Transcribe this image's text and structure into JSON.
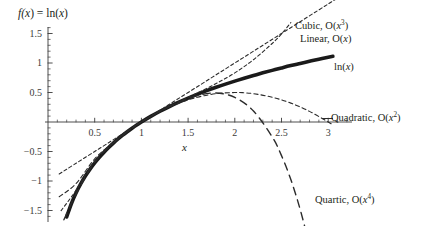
{
  "chart_data": {
    "type": "line",
    "title": "f(x) = ln(x)",
    "subtitle": "",
    "xlabel": "x",
    "ylabel": "",
    "xlim": [
      0.05,
      3.35
    ],
    "ylim": [
      -1.75,
      1.75
    ],
    "grid": false,
    "legend_position": "inline-annotations",
    "xticks": [
      0.5,
      1,
      1.5,
      2,
      2.5,
      3
    ],
    "xtick_labels": [
      "0.5",
      "1",
      "1.5",
      "2",
      "2.5",
      "3"
    ],
    "yticks": [
      -1.5,
      -1,
      -0.5,
      0.5,
      1,
      1.5
    ],
    "ytick_labels": [
      "-1.5",
      "-1",
      "-0.5",
      "0.5",
      "1",
      "1.5"
    ],
    "xminor_step": 0.1,
    "yminor_step": 0.1,
    "annotations": [
      {
        "text": "Cubic, O(x",
        "sup": "3",
        "tail": ")",
        "x": 295,
        "y": 21,
        "name": "cubic"
      },
      {
        "text": "Linear, O(x",
        "sup": "",
        "tail": ")",
        "x": 300,
        "y": 34,
        "name": "linear"
      },
      {
        "text": "ln(x",
        "sup": "",
        "tail": ")",
        "x": 334,
        "y": 62,
        "name": "ln"
      },
      {
        "text": "Quadratic, O(x",
        "sup": "2",
        "tail": ")",
        "x": 331,
        "y": 113,
        "name": "quadratic"
      },
      {
        "text": "Quartic, O(x",
        "sup": "4",
        "tail": ")",
        "x": 315,
        "y": 195,
        "name": "quartic"
      }
    ],
    "series": [
      {
        "name": "ln(x)",
        "label": "ln(x)",
        "style": "solid-thick",
        "color": "#1a1a1a",
        "width": 3.6,
        "x": [
          0.2,
          0.25,
          0.3,
          0.35,
          0.4,
          0.45,
          0.5,
          0.55,
          0.6,
          0.65,
          0.7,
          0.75,
          0.8,
          0.85,
          0.9,
          0.95,
          1.0,
          1.1,
          1.2,
          1.3,
          1.4,
          1.5,
          1.6,
          1.7,
          1.8,
          1.9,
          2.0,
          2.1,
          2.2,
          2.3,
          2.4,
          2.5,
          2.6,
          2.7,
          2.8,
          2.9,
          3.0,
          3.05
        ],
        "y": [
          -1.609,
          -1.386,
          -1.204,
          -1.05,
          -0.916,
          -0.799,
          -0.693,
          -0.598,
          -0.511,
          -0.431,
          -0.357,
          -0.288,
          -0.223,
          -0.163,
          -0.105,
          -0.051,
          0.0,
          0.095,
          0.182,
          0.262,
          0.336,
          0.405,
          0.47,
          0.531,
          0.588,
          0.642,
          0.693,
          0.742,
          0.788,
          0.833,
          0.875,
          0.916,
          0.956,
          0.993,
          1.03,
          1.065,
          1.099,
          1.115
        ]
      },
      {
        "name": "Linear, O(x)",
        "label": "Linear, O(x)",
        "style": "dashed-short",
        "color": "#2b2b2b",
        "width": 1.1,
        "formula": "(x-1)",
        "x": [
          0.12,
          0.5,
          1.0,
          1.5,
          2.0,
          2.5,
          3.0,
          3.3
        ],
        "y": [
          -0.88,
          -0.5,
          0.0,
          0.5,
          1.0,
          1.5,
          2.0,
          2.3
        ]
      },
      {
        "name": "Quadratic, O(x^2)",
        "label": "Quadratic, O(x2)",
        "style": "dashed-med",
        "color": "#2b2b2b",
        "width": 1.1,
        "formula": "(x-1) - (x-1)^2/2",
        "x": [
          0.12,
          0.3,
          0.5,
          0.7,
          0.9,
          1.0,
          1.2,
          1.4,
          1.6,
          1.8,
          2.0,
          2.1,
          2.2,
          2.4,
          2.6,
          2.8,
          3.0,
          3.05
        ],
        "y": [
          -1.267,
          -1.045,
          -0.625,
          -0.345,
          -0.105,
          0.0,
          0.18,
          0.32,
          0.42,
          0.48,
          0.5,
          0.495,
          0.48,
          0.42,
          0.32,
          0.18,
          0.0,
          -0.051
        ]
      },
      {
        "name": "Cubic, O(x^3)",
        "label": "Cubic, O(x3)",
        "style": "dashed-short",
        "color": "#2b2b2b",
        "width": 1.1,
        "formula": "(x-1) - (x-1)^2/2 + (x-1)^3/3",
        "x": [
          0.14,
          0.3,
          0.5,
          0.7,
          0.9,
          1.0,
          1.2,
          1.4,
          1.6,
          1.8,
          2.0,
          2.2,
          2.4,
          2.5,
          2.6
        ],
        "y": [
          -1.503,
          -1.159,
          -0.667,
          -0.354,
          -0.105,
          0.0,
          0.183,
          0.341,
          0.492,
          0.651,
          0.833,
          1.056,
          1.331,
          1.493,
          1.685
        ]
      },
      {
        "name": "Quartic, O(x^4)",
        "label": "Quartic, O(x4)",
        "style": "dashed-long",
        "color": "#2b2b2b",
        "width": 1.4,
        "formula": "(x-1) - (x-1)^2/2 + (x-1)^3/3 - (x-1)^4/4",
        "x": [
          0.17,
          0.3,
          0.5,
          0.7,
          0.9,
          1.0,
          1.2,
          1.4,
          1.6,
          1.8,
          2.0,
          2.2,
          2.4,
          2.5,
          2.6,
          2.7,
          2.8,
          2.85
        ],
        "y": [
          -1.657,
          -1.219,
          -0.683,
          -0.356,
          -0.105,
          0.0,
          0.183,
          0.337,
          0.451,
          0.491,
          0.417,
          0.186,
          -0.251,
          -0.57,
          -0.976,
          -1.482,
          -2.101,
          -2.46
        ]
      }
    ]
  },
  "axes": {
    "x_axis_name": "x-axis",
    "y_axis_name": "y-axis",
    "x_label": "x",
    "title": "f(x) = ln(x)"
  },
  "title_parts": {
    "f": "f",
    "open": "(x",
    "eq": ") = ln(",
    "var": "x",
    "close": ")"
  }
}
